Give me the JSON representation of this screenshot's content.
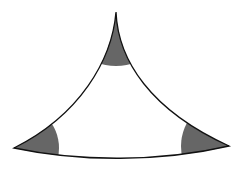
{
  "diagram": {
    "type": "curvilinear-triangle",
    "colors": {
      "background": "#ffffff",
      "stroke": "#111111",
      "shade": "#666666"
    },
    "vertices": {
      "top": [
        116,
        12
      ],
      "left": [
        14,
        148
      ],
      "right": [
        229,
        146
      ]
    },
    "shaded_sectors": [
      {
        "vertex": "top",
        "label": ""
      },
      {
        "vertex": "left",
        "label": ""
      },
      {
        "vertex": "right",
        "label": ""
      }
    ]
  }
}
